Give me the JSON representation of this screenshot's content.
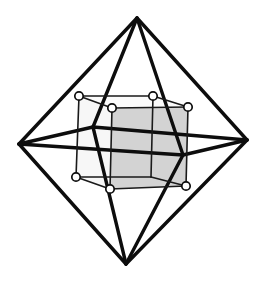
{
  "figure": {
    "title": "Cube inscribed in octahedron",
    "caption": "",
    "background_color": "#ffffff",
    "canvas": {
      "width": 260,
      "height": 283
    },
    "line_color": "#0d0d0d",
    "cube_face_fill_shaded": "#d3d3d3",
    "cube_face_fill_light": "#f7f7f7",
    "cube_edge_color": "#1a1a1a",
    "vertex_marker_fill": "#ffffff",
    "vertex_marker_stroke": "#0d0d0d",
    "octahedron": {
      "name": "octahedron",
      "edge_width": 3.4,
      "vertices": {
        "top": {
          "label": "top apex",
          "x": 137,
          "y": 18
        },
        "bottom": {
          "label": "bottom apex",
          "x": 126,
          "y": 264
        },
        "left": {
          "label": "left vertex",
          "x": 19,
          "y": 144
        },
        "right": {
          "label": "right vertex",
          "x": 247,
          "y": 140
        },
        "front": {
          "label": "front vertex",
          "x": 183,
          "y": 155
        },
        "back": {
          "label": "back vertex",
          "x": 93,
          "y": 127
        }
      },
      "edges": [
        [
          "top",
          "left"
        ],
        [
          "top",
          "right"
        ],
        [
          "top",
          "front"
        ],
        [
          "top",
          "back"
        ],
        [
          "bottom",
          "left"
        ],
        [
          "bottom",
          "right"
        ],
        [
          "bottom",
          "front"
        ],
        [
          "bottom",
          "back"
        ],
        [
          "left",
          "front"
        ],
        [
          "front",
          "right"
        ],
        [
          "right",
          "back"
        ],
        [
          "back",
          "left"
        ]
      ]
    },
    "cube": {
      "name": "cube",
      "edge_width": 1.6,
      "vertices": {
        "back_top_left": {
          "label": "back top left",
          "x": 79,
          "y": 96
        },
        "back_top_right": {
          "label": "back top right",
          "x": 153,
          "y": 96
        },
        "front_top_right": {
          "label": "front top right",
          "x": 188,
          "y": 107
        },
        "front_top_left": {
          "label": "front top left",
          "x": 112,
          "y": 108
        },
        "back_bottom_left": {
          "label": "back bottom left",
          "x": 76,
          "y": 177
        },
        "back_bottom_right": {
          "label": "back bottom right",
          "x": 151,
          "y": 177
        },
        "front_bottom_right": {
          "label": "front bottom right",
          "x": 186,
          "y": 186
        },
        "front_bottom_left": {
          "label": "front bottom left",
          "x": 110,
          "y": 189
        }
      },
      "visible_vertex_markers": [
        "back_top_left",
        "back_top_right",
        "front_top_right",
        "front_top_left",
        "back_bottom_left",
        "front_bottom_right",
        "front_bottom_left"
      ],
      "marker_radius": 4.2,
      "faces": [
        {
          "name": "right-face",
          "fill": "#d3d3d3",
          "corners": [
            "front_top_left",
            "front_top_right",
            "front_bottom_right",
            "front_bottom_left"
          ]
        },
        {
          "name": "left-face",
          "fill": "#f7f7f7",
          "corners": [
            "back_top_left",
            "front_top_left",
            "front_bottom_left",
            "back_bottom_left"
          ]
        },
        {
          "name": "top-face",
          "fill": "#fbfbfb",
          "corners": [
            "back_top_left",
            "back_top_right",
            "front_top_right",
            "front_top_left"
          ]
        }
      ],
      "edges": [
        [
          "back_top_left",
          "back_top_right"
        ],
        [
          "back_top_right",
          "front_top_right"
        ],
        [
          "front_top_right",
          "front_top_left"
        ],
        [
          "front_top_left",
          "back_top_left"
        ],
        [
          "back_bottom_left",
          "back_bottom_right"
        ],
        [
          "back_bottom_right",
          "front_bottom_right"
        ],
        [
          "front_bottom_right",
          "front_bottom_left"
        ],
        [
          "front_bottom_left",
          "back_bottom_left"
        ],
        [
          "back_top_left",
          "back_bottom_left"
        ],
        [
          "back_top_right",
          "back_bottom_right"
        ],
        [
          "front_top_right",
          "front_bottom_right"
        ],
        [
          "front_top_left",
          "front_bottom_left"
        ]
      ]
    }
  }
}
